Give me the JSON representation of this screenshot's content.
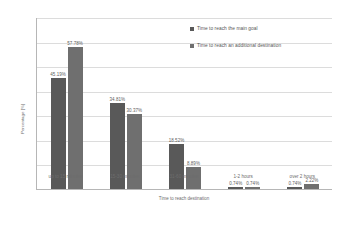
{
  "chart_data": {
    "type": "bar",
    "title": "",
    "xlabel": "Time to reach destination",
    "ylabel": "Percentage [%]",
    "categories": [
      "up to 15 minutes",
      "15-30 minutes",
      "31-60 minutes",
      "1-2 hours",
      "over 2 hours"
    ],
    "series": [
      {
        "name": "Time to reach the main goal",
        "color": "#595959",
        "values": [
          45.19,
          34.81,
          18.52,
          0.74,
          0.74
        ],
        "labels": [
          "45.19%",
          "34.81%",
          "18.52%",
          "0.74%",
          "0.74%"
        ]
      },
      {
        "name": "Time to reach an additional destination",
        "color": "#6f6f6f",
        "values": [
          57.78,
          30.37,
          8.89,
          0.74,
          2.22
        ],
        "labels": [
          "57.78%",
          "30.37%",
          "8.89%",
          "0.74%",
          "2.22%"
        ]
      }
    ],
    "ylim": [
      0,
      70
    ],
    "yticks": [
      0,
      10,
      20,
      30,
      40,
      50,
      60,
      70
    ],
    "ytick_labels": [
      "0%",
      "10%",
      "20%",
      "30%",
      "40%",
      "50%",
      "60%",
      "70%"
    ],
    "grid": true,
    "legend_position": "top-right"
  }
}
